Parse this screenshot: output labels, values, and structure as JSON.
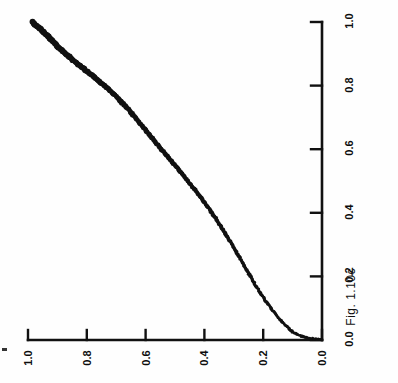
{
  "figure": {
    "caption": "Fig. 1.10c",
    "orientation_note": "rotated-90"
  },
  "chart_data": {
    "type": "scatter",
    "title": "",
    "subtitle": "",
    "xlabel": "",
    "ylabel": "",
    "xlim": [
      0.0,
      1.0
    ],
    "ylim": [
      0.0,
      1.0
    ],
    "grid": false,
    "legend": "none",
    "marker": "dot",
    "color": "#111111",
    "x_ticklabels": [
      "0.0",
      "0.2",
      "0.4",
      "0.6",
      "0.8",
      "1.0"
    ],
    "x_tickvalues": [
      0.0,
      0.2,
      0.4,
      0.6,
      0.8,
      1.0
    ],
    "y_ticklabels": [
      "0.0",
      "0.2",
      "0.4",
      "0.6",
      "0.8",
      "1.0"
    ],
    "y_tickvalues": [
      0.0,
      0.2,
      0.4,
      0.6,
      0.8,
      1.0
    ],
    "x": [
      0.0,
      0.002,
      0.004,
      0.006,
      0.008,
      0.01,
      0.012,
      0.014,
      0.016,
      0.018,
      0.02,
      0.023,
      0.026,
      0.03,
      0.034,
      0.038,
      0.043,
      0.048,
      0.054,
      0.06,
      0.067,
      0.074,
      0.082,
      0.09,
      0.099,
      0.108,
      0.118,
      0.128,
      0.139,
      0.15,
      0.162,
      0.174,
      0.187,
      0.2,
      0.214,
      0.228,
      0.243,
      0.258,
      0.274,
      0.29,
      0.307,
      0.324,
      0.342,
      0.36,
      0.379,
      0.398,
      0.418,
      0.438,
      0.459,
      0.48,
      0.502,
      0.524,
      0.547,
      0.57,
      0.594,
      0.618,
      0.643,
      0.668,
      0.694,
      0.72,
      0.747,
      0.774,
      0.802,
      0.83,
      0.859,
      0.888,
      0.918,
      0.948,
      0.975,
      1.0
    ],
    "y": [
      0.0,
      0.018,
      0.033,
      0.046,
      0.056,
      0.064,
      0.071,
      0.077,
      0.082,
      0.086,
      0.09,
      0.095,
      0.1,
      0.105,
      0.11,
      0.115,
      0.121,
      0.127,
      0.133,
      0.139,
      0.146,
      0.152,
      0.159,
      0.166,
      0.173,
      0.18,
      0.188,
      0.195,
      0.203,
      0.211,
      0.219,
      0.227,
      0.235,
      0.243,
      0.252,
      0.261,
      0.27,
      0.28,
      0.29,
      0.3,
      0.311,
      0.322,
      0.334,
      0.346,
      0.359,
      0.373,
      0.388,
      0.404,
      0.421,
      0.439,
      0.458,
      0.478,
      0.498,
      0.519,
      0.541,
      0.563,
      0.585,
      0.607,
      0.63,
      0.654,
      0.68,
      0.709,
      0.742,
      0.779,
      0.818,
      0.857,
      0.893,
      0.925,
      0.955,
      0.985
    ]
  },
  "axes": {
    "x_axis_label": "",
    "y_axis_label": ""
  }
}
